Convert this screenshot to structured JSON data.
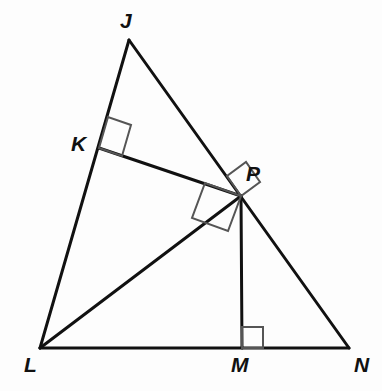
{
  "figure": {
    "kind": "geometry-diagram",
    "background_color": "#fdfdfd",
    "stroke_color": "#111111",
    "right_angle_mark_color": "#555555",
    "width": 382,
    "height": 391
  },
  "points": [
    {
      "id": "J",
      "label": "J",
      "x": 129,
      "y": 40,
      "label_x": 120,
      "label_y": 10
    },
    {
      "id": "K",
      "label": "K",
      "x": 99,
      "y": 148,
      "label_x": 71,
      "label_y": 133
    },
    {
      "id": "P",
      "label": "P",
      "x": 241,
      "y": 196,
      "label_x": 246,
      "label_y": 163
    },
    {
      "id": "L",
      "label": "L",
      "x": 40,
      "y": 348,
      "label_x": 24,
      "label_y": 354
    },
    {
      "id": "M",
      "label": "M",
      "x": 242,
      "y": 348,
      "label_x": 231,
      "label_y": 354
    },
    {
      "id": "N",
      "label": "N",
      "x": 349,
      "y": 348,
      "label_x": 354,
      "label_y": 354
    }
  ],
  "segments": [
    {
      "id": "JL",
      "name": "side-jl",
      "from": "J",
      "to": "L",
      "x1": 129,
      "y1": 40,
      "x2": 40,
      "y2": 348,
      "width": 3
    },
    {
      "id": "JN",
      "name": "side-jn",
      "from": "J",
      "to": "N",
      "x1": 129,
      "y1": 40,
      "x2": 349,
      "y2": 348,
      "width": 3
    },
    {
      "id": "LN",
      "name": "side-ln",
      "from": "L",
      "to": "N",
      "x1": 40,
      "y1": 348,
      "x2": 349,
      "y2": 348,
      "width": 3
    },
    {
      "id": "KP",
      "name": "altitude-kp",
      "from": "K",
      "to": "P",
      "x1": 99,
      "y1": 148,
      "x2": 241,
      "y2": 196,
      "width": 3
    },
    {
      "id": "LP",
      "name": "altitude-lp",
      "from": "L",
      "to": "P",
      "x1": 40,
      "y1": 348,
      "x2": 241,
      "y2": 196,
      "width": 3
    },
    {
      "id": "PM",
      "name": "altitude-pm",
      "from": "P",
      "to": "M",
      "x1": 241,
      "y1": 196,
      "x2": 242,
      "y2": 348,
      "width": 3
    }
  ],
  "right_angle_marks": [
    {
      "id": "angle-at-K",
      "name": "right-angle-mark-k",
      "at": "K",
      "color": "#555555",
      "points": "99,148 108,117 131,125 122,156"
    },
    {
      "id": "angle-at-P-upper",
      "name": "right-angle-mark-p-upper",
      "at": "P",
      "color": "#555555",
      "points": "241,196 227,176 246,162 260,182"
    },
    {
      "id": "angle-at-P-lower",
      "name": "right-angle-mark-p-lower",
      "at": "P",
      "color": "#555555",
      "points": "241,196 205,183 192,218 228,231"
    },
    {
      "id": "angle-at-M",
      "name": "right-angle-mark-m",
      "at": "M",
      "color": "#555555",
      "points": "242,348 242,327 263,327 263,348"
    }
  ]
}
